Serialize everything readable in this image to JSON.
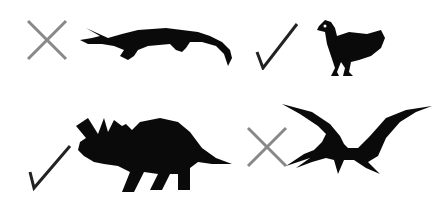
{
  "items": [
    {
      "animal": "crocodile",
      "mark": "cross",
      "mark_color": "#888888"
    },
    {
      "animal": "chicken",
      "mark": "check",
      "mark_color": "#222222"
    },
    {
      "animal": "triceratops",
      "mark": "check",
      "mark_color": "#222222"
    },
    {
      "animal": "pterodactyl",
      "mark": "cross",
      "mark_color": "#888888"
    }
  ],
  "colors": {
    "silhouette": "#0a0a0a",
    "background": "#ffffff"
  }
}
